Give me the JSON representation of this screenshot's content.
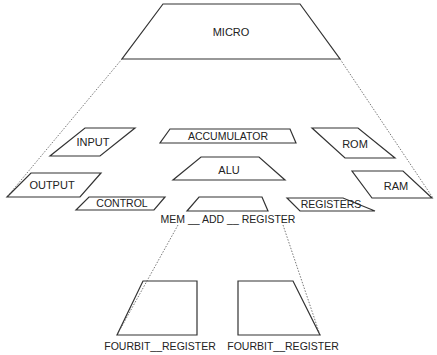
{
  "diagram": {
    "type": "hierarchical-block-diagram",
    "colors": {
      "stroke": "#333333",
      "text": "#222222",
      "background": "#ffffff"
    },
    "nodes": [
      {
        "id": "micro",
        "label": "MICRO",
        "shape": "trapezoid",
        "points": "163,4 300,4 340,59 122,59",
        "tx": 231,
        "ty": 36,
        "fs": 11
      },
      {
        "id": "input",
        "label": "INPUT",
        "shape": "parallelogram",
        "points": "85,128 135,128 100,156 50,156",
        "tx": 93,
        "ty": 146,
        "fs": 11
      },
      {
        "id": "accumulator",
        "label": "ACCUMULATOR",
        "shape": "trapezoid",
        "points": "170,129 290,129 296,143 160,143",
        "tx": 228,
        "ty": 140,
        "fs": 10.5
      },
      {
        "id": "rom",
        "label": "ROM",
        "shape": "parallelogram",
        "points": "312,128 358,128 395,158 345,158",
        "tx": 355,
        "ty": 148,
        "fs": 11
      },
      {
        "id": "alu",
        "label": "ALU",
        "shape": "trapezoid",
        "points": "201,157 259,157 285,180 173,180",
        "tx": 229,
        "ty": 174,
        "fs": 11
      },
      {
        "id": "output",
        "label": "OUTPUT",
        "shape": "parallelogram",
        "points": "31,173 101,173 80,197 7,197",
        "tx": 52,
        "ty": 189,
        "fs": 11
      },
      {
        "id": "ram",
        "label": "RAM",
        "shape": "parallelogram",
        "points": "352,171 403,171 432,198 372,198",
        "tx": 396,
        "ty": 190,
        "fs": 11
      },
      {
        "id": "control",
        "label": "CONTROL",
        "shape": "parallelogram",
        "points": "89,197 165,197 154,210 76,210",
        "tx": 122,
        "ty": 207,
        "fs": 10.5
      },
      {
        "id": "mem_add_register",
        "label": "MEM __ ADD __ REGISTER",
        "shape": "trapezoid",
        "points": "199,197 262,197 268,211 187,211",
        "tx": 228,
        "ty": 223,
        "fs": 10.5
      },
      {
        "id": "registers",
        "label": "REGISTERS",
        "shape": "parallelogram",
        "points": "287,198 343,198 375,211 300,211",
        "tx": 331,
        "ty": 208,
        "fs": 10.5
      },
      {
        "id": "fourbit_register_1",
        "label": "FOURBIT__REGISTER",
        "shape": "trapezoid",
        "points": "143,281 197,281 197,335 117,335",
        "tx": 160,
        "ty": 350,
        "fs": 10.5
      },
      {
        "id": "fourbit_register_2",
        "label": "FOURBIT__REGISTER",
        "shape": "trapezoid",
        "points": "238,281 293,281 320,335 238,335",
        "tx": 283,
        "ty": 350,
        "fs": 10.5
      }
    ],
    "edges": [
      {
        "from": "micro",
        "to": "output",
        "style": "dotted",
        "x1": 122,
        "y1": 59,
        "x2": 7,
        "y2": 197
      },
      {
        "from": "micro",
        "to": "ram",
        "style": "dotted",
        "x1": 340,
        "y1": 59,
        "x2": 433,
        "y2": 198
      },
      {
        "from": "mem_add_register",
        "to": "fourbit_register_1",
        "style": "dotted",
        "x1": 178,
        "y1": 225,
        "x2": 117,
        "y2": 335
      },
      {
        "from": "mem_add_register",
        "to": "fourbit_register_2",
        "style": "dotted",
        "x1": 283,
        "y1": 225,
        "x2": 320,
        "y2": 335
      }
    ]
  }
}
